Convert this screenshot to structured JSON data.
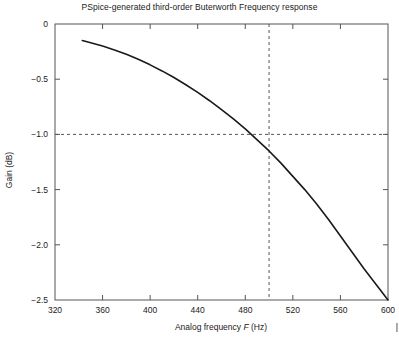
{
  "chart_data": {
    "type": "line",
    "title": "PSpice-generated third-order Buterworth Frequency response",
    "xlabel_prefix": "Analog frequency ",
    "xlabel_symbol": "F",
    "xlabel_suffix": " (Hz)",
    "ylabel": "Gain (dB)",
    "xlim": [
      320,
      600
    ],
    "ylim": [
      -2.5,
      0
    ],
    "xticks": [
      320,
      360,
      400,
      440,
      480,
      520,
      560,
      600
    ],
    "xtick_labels": [
      "320",
      "360",
      "400",
      "440",
      "480",
      "520",
      "560",
      "600"
    ],
    "yticks": [
      0,
      -0.5,
      -1.0,
      -1.5,
      -2.0,
      -2.5
    ],
    "ytick_labels": [
      "0",
      "−0.5",
      "−1.0",
      "−1.5",
      "−2.0",
      "−2.5"
    ],
    "grid": false,
    "legend": null,
    "series": [
      {
        "name": "gain",
        "color": "#1a1a1a",
        "x": [
          343,
          350,
          360,
          370,
          380,
          390,
          400,
          410,
          420,
          430,
          440,
          450,
          460,
          470,
          480,
          490,
          500,
          510,
          520,
          530,
          540,
          550,
          560,
          570,
          580,
          590,
          600
        ],
        "y": [
          -0.15,
          -0.17,
          -0.2,
          -0.235,
          -0.275,
          -0.32,
          -0.37,
          -0.425,
          -0.485,
          -0.55,
          -0.62,
          -0.695,
          -0.775,
          -0.86,
          -0.95,
          -1.05,
          -1.15,
          -1.26,
          -1.38,
          -1.5,
          -1.63,
          -1.77,
          -1.92,
          -2.07,
          -2.22,
          -2.36,
          -2.5
        ]
      }
    ],
    "annotations": [
      {
        "name": "cutoff-vertical-guide",
        "type": "vline",
        "x": 500,
        "style": "dashed",
        "color": "#555555"
      },
      {
        "name": "minus-one-db-horizontal-guide",
        "type": "hline",
        "y": -1.0,
        "style": "dashed",
        "color": "#555555"
      }
    ],
    "axes_color": "#555555",
    "edge_mark": "|"
  }
}
